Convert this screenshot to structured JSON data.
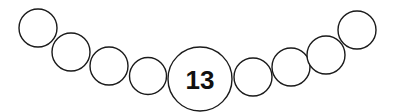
{
  "diagram": {
    "type": "bead-chain",
    "center_label": "13",
    "stroke_color": "#1a1a1a",
    "background": "#ffffff",
    "beads": [
      {
        "cx": 38,
        "cy": 28,
        "r": 19,
        "label": ""
      },
      {
        "cx": 71,
        "cy": 52,
        "r": 19,
        "label": ""
      },
      {
        "cx": 109,
        "cy": 66,
        "r": 19,
        "label": ""
      },
      {
        "cx": 148,
        "cy": 76,
        "r": 18.5,
        "label": ""
      },
      {
        "cx": 200,
        "cy": 79,
        "r": 32,
        "label": "13"
      },
      {
        "cx": 253,
        "cy": 77,
        "r": 19,
        "label": ""
      },
      {
        "cx": 291,
        "cy": 67,
        "r": 19,
        "label": ""
      },
      {
        "cx": 326,
        "cy": 55,
        "r": 19,
        "label": ""
      },
      {
        "cx": 357,
        "cy": 30,
        "r": 19,
        "label": ""
      }
    ]
  }
}
